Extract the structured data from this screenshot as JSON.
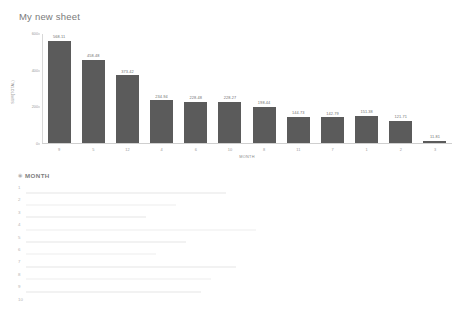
{
  "sheet": {
    "title": "My new sheet"
  },
  "chart_data": {
    "type": "bar",
    "title": "My new sheet",
    "xlabel": "MONTH",
    "ylabel": "SUM(TOTAL)",
    "ylim": [
      0,
      600
    ],
    "yticks": [
      "0",
      "200",
      "400",
      "600"
    ],
    "grid": false,
    "legend": "none",
    "categories": [
      "9",
      "5",
      "12",
      "4",
      "6",
      "10",
      "8",
      "11",
      "7",
      "1",
      "2",
      "3"
    ],
    "values": [
      568.11,
      458.48,
      373.42,
      234.94,
      228.48,
      228.27,
      198.44,
      144.73,
      142.79,
      151.38,
      121.71,
      11.81
    ],
    "value_labels": [
      "568.11",
      "458.48",
      "373.42",
      "234.94",
      "228.48",
      "228.27",
      "198.44",
      "144.73",
      "142.79",
      "151.38",
      "121.71",
      "11.81"
    ],
    "bar_color": "#5b5b5b"
  },
  "table": {
    "column_icon": "number-type-icon",
    "column_header": "MONTH",
    "row_numbers": [
      "1",
      "2",
      "3",
      "4",
      "5",
      "6",
      "7",
      "8",
      "9",
      "10"
    ]
  }
}
